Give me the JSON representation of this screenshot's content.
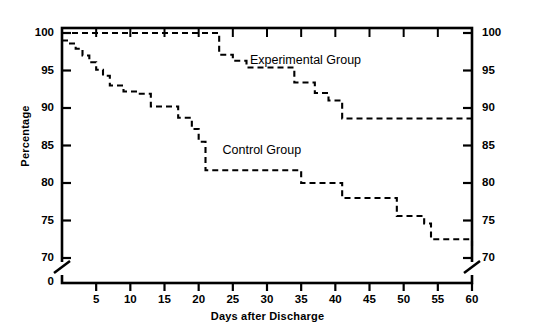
{
  "chart_data": {
    "type": "line",
    "title": "",
    "xlabel": "Days after Discharge",
    "ylabel": "Percentage",
    "xlim": [
      0,
      60
    ],
    "ylim": [
      70,
      100
    ],
    "y_axis_break": true,
    "y_break_label": "0",
    "xticks": [
      0,
      5,
      10,
      15,
      20,
      25,
      30,
      35,
      40,
      45,
      50,
      55,
      60
    ],
    "xticklabels": [
      "",
      "5",
      "10",
      "15",
      "20",
      "25",
      "30",
      "35",
      "40",
      "45",
      "50",
      "55",
      "60"
    ],
    "yticks": [
      70,
      75,
      80,
      85,
      90,
      95,
      100
    ],
    "yticklabels": [
      "70",
      "75",
      "80",
      "85",
      "90",
      "95",
      "100"
    ],
    "yticklabels_right": [
      "70",
      "75",
      "80",
      "85",
      "90",
      "95",
      "100"
    ],
    "grid": false,
    "legend": "inline-annotations",
    "linestyle": "dashed",
    "step": "post",
    "series": [
      {
        "name": "Experimental Group",
        "label_x": 27.5,
        "label_y": 96.3,
        "x": [
          0,
          21,
          23,
          25,
          27,
          34,
          37,
          39,
          41,
          60
        ],
        "y": [
          100,
          100,
          97.1,
          96.3,
          95.4,
          93.4,
          92.0,
          91.0,
          88.6,
          88.6
        ]
      },
      {
        "name": "Control Group",
        "label_x": 23.5,
        "label_y": 84.3,
        "x": [
          0,
          1,
          2,
          3,
          4,
          5,
          6,
          7,
          9,
          11,
          12,
          13,
          15,
          17,
          19,
          20,
          21,
          34,
          35,
          41,
          47,
          49,
          53,
          54,
          59,
          60
        ],
        "y": [
          99.0,
          98.6,
          97.9,
          97.0,
          96.1,
          95.1,
          94.3,
          93.0,
          92.2,
          91.9,
          91.9,
          90.2,
          90.2,
          88.7,
          87.2,
          85.5,
          81.7,
          81.7,
          80.0,
          78.0,
          78.0,
          75.6,
          74.6,
          72.5,
          72.5,
          71.5
        ]
      }
    ]
  },
  "annotations": {
    "experimental_label": "Experimental Group",
    "control_label": "Control Group"
  }
}
